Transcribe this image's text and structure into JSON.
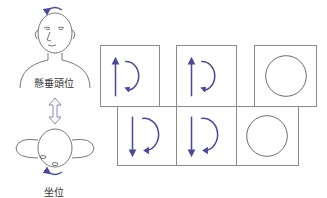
{
  "labels": {
    "top_position": "懸垂頭位",
    "bottom_position": "坐位"
  },
  "colors": {
    "arrow": "#4a4a9a",
    "line": "#555555",
    "box_border": "#8a8a8a"
  },
  "top_row": [
    {
      "icon": "up-arrow-with-ccw-rotation"
    },
    {
      "icon": "up-arrow-with-ccw-rotation"
    },
    {
      "icon": "empty-circle"
    }
  ],
  "bottom_row": [
    {
      "icon": "down-arrow-with-cw-rotation"
    },
    {
      "icon": "down-arrow-with-cw-rotation"
    },
    {
      "icon": "empty-circle"
    }
  ]
}
